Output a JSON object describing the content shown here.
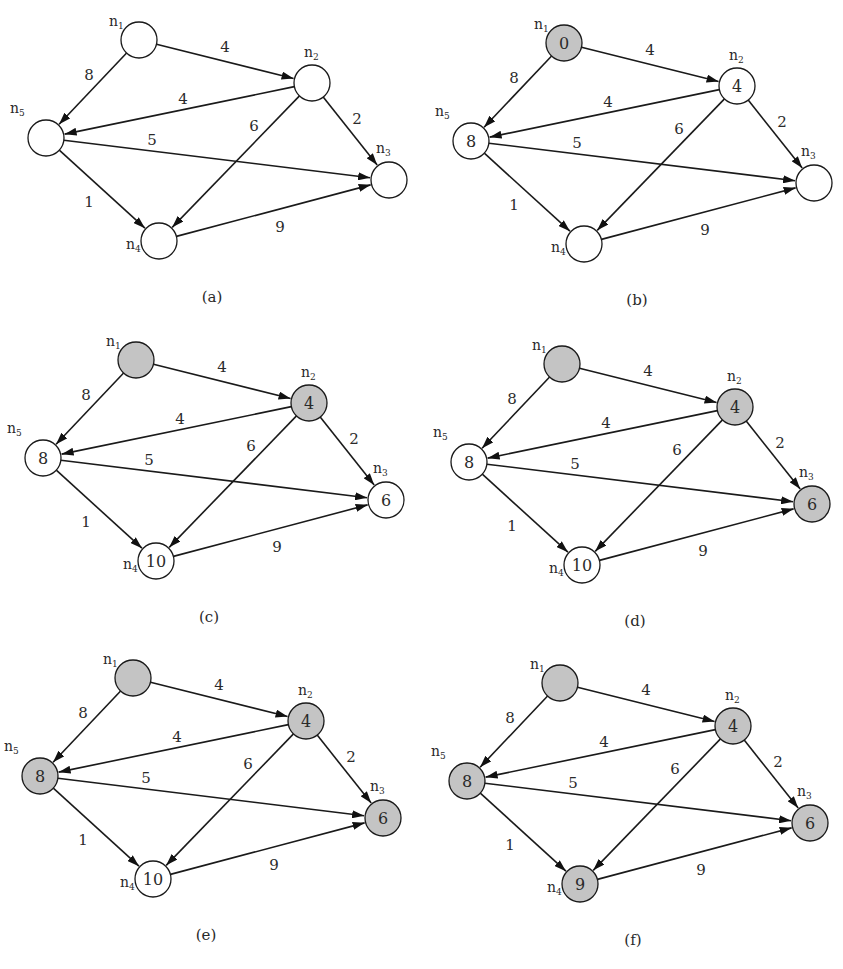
{
  "figure": {
    "node_labels": {
      "n1": "n1",
      "n2": "n2",
      "n3": "n3",
      "n4": "n4",
      "n5": "n5"
    },
    "colors": {
      "visited_fill": "#c4c4c4",
      "unvisited_fill": "#ffffff",
      "stroke": "#1a1a1a"
    },
    "layout": {
      "n1": {
        "x": 139,
        "y": 40
      },
      "n2": {
        "x": 312,
        "y": 83
      },
      "n3": {
        "x": 389,
        "y": 180
      },
      "n4": {
        "x": 159,
        "y": 241
      },
      "n5": {
        "x": 46,
        "y": 138
      },
      "radius": 18
    },
    "edges": [
      {
        "from": "n1",
        "to": "n2",
        "weight": "4",
        "lx": 225,
        "ly": 52
      },
      {
        "from": "n1",
        "to": "n5",
        "weight": "8",
        "lx": 89,
        "ly": 80
      },
      {
        "from": "n2",
        "to": "n5",
        "weight": "4",
        "lx": 183,
        "ly": 104
      },
      {
        "from": "n2",
        "to": "n3",
        "weight": "2",
        "lx": 357,
        "ly": 124
      },
      {
        "from": "n2",
        "to": "n4",
        "weight": "6",
        "lx": 254,
        "ly": 131
      },
      {
        "from": "n5",
        "to": "n3",
        "weight": "5",
        "lx": 152,
        "ly": 145
      },
      {
        "from": "n5",
        "to": "n4",
        "weight": "1",
        "lx": 89,
        "ly": 207
      },
      {
        "from": "n4",
        "to": "n3",
        "weight": "9",
        "lx": 280,
        "ly": 232
      }
    ],
    "panels": [
      {
        "caption": "(a)",
        "ox": 0,
        "oy": 0,
        "nodes": {
          "n1": {
            "value": "",
            "visited": false
          },
          "n2": {
            "value": "",
            "visited": false
          },
          "n3": {
            "value": "",
            "visited": false
          },
          "n4": {
            "value": "",
            "visited": false
          },
          "n5": {
            "value": "",
            "visited": false
          }
        }
      },
      {
        "caption": "(b)",
        "ox": 425,
        "oy": 3,
        "nodes": {
          "n1": {
            "value": "0",
            "visited": true
          },
          "n2": {
            "value": "4",
            "visited": false
          },
          "n3": {
            "value": "",
            "visited": false
          },
          "n4": {
            "value": "",
            "visited": false
          },
          "n5": {
            "value": "8",
            "visited": false
          }
        }
      },
      {
        "caption": "(c)",
        "ox": -3,
        "oy": 320,
        "nodes": {
          "n1": {
            "value": "",
            "visited": true
          },
          "n2": {
            "value": "4",
            "visited": true
          },
          "n3": {
            "value": "6",
            "visited": false
          },
          "n4": {
            "value": "10",
            "visited": false
          },
          "n5": {
            "value": "8",
            "visited": false
          }
        }
      },
      {
        "caption": "(d)",
        "ox": 423,
        "oy": 324,
        "nodes": {
          "n1": {
            "value": "",
            "visited": true
          },
          "n2": {
            "value": "4",
            "visited": true
          },
          "n3": {
            "value": "6",
            "visited": true
          },
          "n4": {
            "value": "10",
            "visited": false
          },
          "n5": {
            "value": "8",
            "visited": false
          }
        }
      },
      {
        "caption": "(e)",
        "ox": -6,
        "oy": 638,
        "nodes": {
          "n1": {
            "value": "",
            "visited": true
          },
          "n2": {
            "value": "4",
            "visited": true
          },
          "n3": {
            "value": "6",
            "visited": true
          },
          "n4": {
            "value": "10",
            "visited": false
          },
          "n5": {
            "value": "8",
            "visited": true
          }
        }
      },
      {
        "caption": "(f)",
        "ox": 421,
        "oy": 643,
        "nodes": {
          "n1": {
            "value": "",
            "visited": true
          },
          "n2": {
            "value": "4",
            "visited": true
          },
          "n3": {
            "value": "6",
            "visited": true
          },
          "n4": {
            "value": "9",
            "visited": true
          },
          "n5": {
            "value": "8",
            "visited": true
          }
        }
      }
    ]
  }
}
